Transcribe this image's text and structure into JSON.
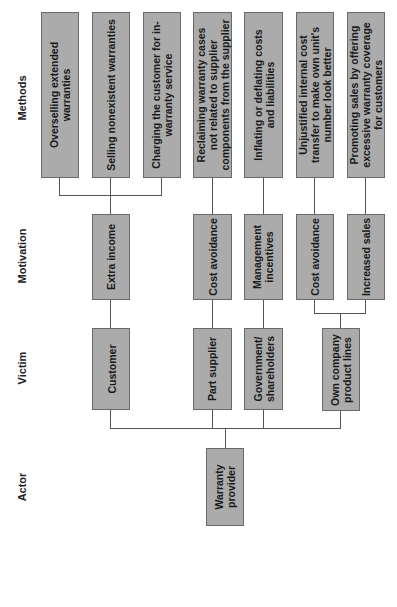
{
  "columns": {
    "methods": "Methods",
    "motivation": "Motivation",
    "victim": "Victim",
    "actor": "Actor"
  },
  "actor": {
    "label": "Warranty\nprovider"
  },
  "victims": [
    {
      "label": "Customer"
    },
    {
      "label": "Part supplier"
    },
    {
      "label": "Government/\nshareholders"
    },
    {
      "label": "Own company\nproduct lines"
    }
  ],
  "motivations": [
    {
      "label": "Extra income"
    },
    {
      "label": "Cost avoidance"
    },
    {
      "label": "Management\nincentives"
    },
    {
      "label": "Cost avoidance"
    },
    {
      "label": "Increased sales"
    }
  ],
  "methods": [
    {
      "label": "Overselling extended\nwarranties"
    },
    {
      "label": "Selling nonexistent warranties"
    },
    {
      "label": "Charging the customer for in-\nwarranty service"
    },
    {
      "label": "Reclaiming warranty cases\nnot related to supplier\ncomponents from the supplier"
    },
    {
      "label": "Inflating or deflating costs\nand liabilities"
    },
    {
      "label": "Unjustified internal cost\ntransfer to make own unit's\nnumber look better"
    },
    {
      "label": "Promoting sales by offering\nexcessive warranty coverage\nfor customers"
    }
  ],
  "colors": {
    "box_fill": "#ababab",
    "box_border": "#6a6a6a",
    "line": "#555555"
  }
}
